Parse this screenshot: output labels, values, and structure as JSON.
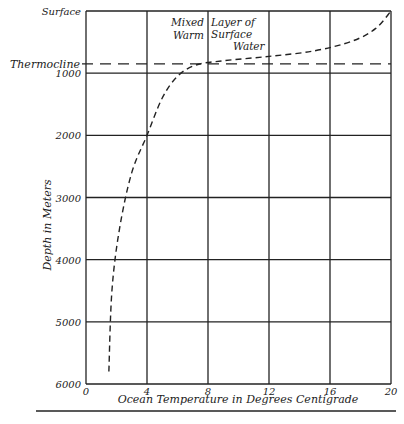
{
  "chart_data": {
    "type": "line",
    "title": "",
    "xlabel": "Ocean Temperature in Degrees Centigrade",
    "ylabel": "Depth in Meters",
    "xlim": [
      0,
      20
    ],
    "ylim": [
      0,
      6000
    ],
    "y_inverted": true,
    "grid": true,
    "x_ticks": [
      0,
      4,
      8,
      12,
      16,
      20
    ],
    "x_tick_labels": [
      "0",
      "4",
      "8",
      "12",
      "16",
      "20"
    ],
    "y_ticks": [
      0,
      1000,
      2000,
      3000,
      4000,
      5000,
      6000
    ],
    "y_tick_labels": [
      "Surface",
      "1000",
      "2000",
      "3000",
      "4000",
      "5000",
      "6000"
    ],
    "series": [
      {
        "name": "Temperature profile",
        "style": "dashed",
        "points": [
          {
            "x": 1.5,
            "y": 5800
          },
          {
            "x": 1.7,
            "y": 4500
          },
          {
            "x": 2.2,
            "y": 3500
          },
          {
            "x": 3.0,
            "y": 2600
          },
          {
            "x": 4.0,
            "y": 2000
          },
          {
            "x": 5.0,
            "y": 1400
          },
          {
            "x": 6.0,
            "y": 1050
          },
          {
            "x": 7.2,
            "y": 870
          },
          {
            "x": 9.0,
            "y": 800
          },
          {
            "x": 12.0,
            "y": 730
          },
          {
            "x": 15.0,
            "y": 640
          },
          {
            "x": 17.5,
            "y": 480
          },
          {
            "x": 19.0,
            "y": 280
          },
          {
            "x": 20.0,
            "y": 0
          }
        ]
      }
    ],
    "reference_lines": [
      {
        "name": "Thermocline",
        "axis": "y",
        "value": 850,
        "style": "dashed",
        "label": "Thermocline"
      }
    ],
    "annotations": [
      {
        "text_lines": [
          "Mixed",
          "Warm"
        ],
        "anchor": "right of x=8"
      },
      {
        "text_lines": [
          "Layer of",
          "Surface",
          "Water"
        ],
        "anchor": "left of x=8"
      }
    ]
  }
}
